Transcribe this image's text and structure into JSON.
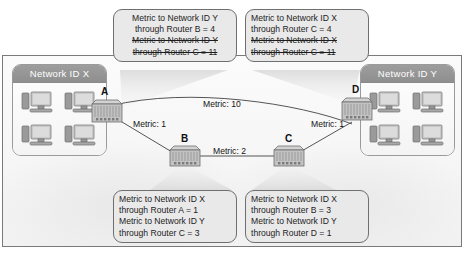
{
  "networks": [
    {
      "id": "net-x",
      "label": "Network ID X",
      "hosts": 4,
      "host_icon": "desktop-computer-icon"
    },
    {
      "id": "net-y",
      "label": "Network ID Y",
      "hosts": 4,
      "host_icon": "desktop-computer-icon"
    }
  ],
  "routers": [
    {
      "id": "router-a",
      "label": "A"
    },
    {
      "id": "router-b",
      "label": "B"
    },
    {
      "id": "router-c",
      "label": "C"
    },
    {
      "id": "router-d",
      "label": "D"
    }
  ],
  "links": [
    {
      "id": "link-a-d",
      "label": "Metric: 10",
      "from": "A",
      "to": "D",
      "metric": 10
    },
    {
      "id": "link-a-b",
      "label": "Metric: 1",
      "from": "A",
      "to": "B",
      "metric": 1
    },
    {
      "id": "link-b-c",
      "label": "Metric: 2",
      "from": "B",
      "to": "C",
      "metric": 2
    },
    {
      "id": "link-c-d",
      "label": "Metric: 1",
      "from": "C",
      "to": "D",
      "metric": 1
    }
  ],
  "callouts": {
    "router_a": {
      "id": "callout-router-a",
      "lines": [
        {
          "text": "Metric to Network ID Y",
          "struck": false
        },
        {
          "text": "through Router B = 4",
          "struck": false
        },
        {
          "text": "Metric to Network ID Y",
          "struck": true
        },
        {
          "text": "through Router C = 11",
          "struck": true
        }
      ]
    },
    "router_d": {
      "id": "callout-router-d",
      "lines": [
        {
          "text": "Metric to Network ID X",
          "struck": false
        },
        {
          "text": "through Router C = 4",
          "struck": false
        },
        {
          "text": "Metric to Network ID X",
          "struck": true
        },
        {
          "text": "through Router C = 11",
          "struck": true
        }
      ]
    },
    "router_b": {
      "id": "callout-router-b",
      "lines": [
        {
          "text": "Metric to Network ID X",
          "struck": false
        },
        {
          "text": "through Router A = 1",
          "struck": false
        },
        {
          "text": "Metric to Network ID Y",
          "struck": false
        },
        {
          "text": "through Router C = 3",
          "struck": false
        }
      ]
    },
    "router_c": {
      "id": "callout-router-c",
      "lines": [
        {
          "text": "Metric to Network ID X",
          "struck": false
        },
        {
          "text": "through Router B = 3",
          "struck": false
        },
        {
          "text": "Metric to Network ID Y",
          "struck": false
        },
        {
          "text": "through Router D = 1",
          "struck": false
        }
      ]
    }
  },
  "colors": {
    "callout_fill": "#e9e9e9",
    "callout_border": "#6f6f6f",
    "panel_header": "#939393",
    "frame_border": "#7a7a7a",
    "link_line": "#555555",
    "router_body": "#b9b9b9"
  }
}
